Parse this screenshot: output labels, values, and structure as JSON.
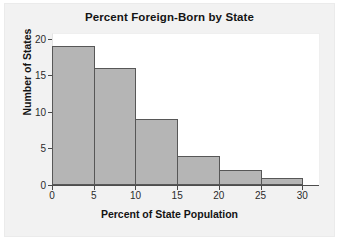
{
  "chart_data": {
    "type": "bar",
    "title": "Percent Foreign-Born by State",
    "xlabel": "Percent of State Population",
    "ylabel": "Number of States",
    "categories": [
      "0-5",
      "5-10",
      "10-15",
      "15-20",
      "20-25",
      "25-30"
    ],
    "bin_edges": [
      0,
      5,
      10,
      15,
      20,
      25,
      30
    ],
    "values": [
      19,
      16,
      9,
      4,
      2,
      1
    ],
    "xlim": [
      0,
      32
    ],
    "ylim": [
      0,
      20.8
    ],
    "xticks": [
      0,
      5,
      10,
      15,
      20,
      25,
      30
    ],
    "yticks": [
      0,
      5,
      10,
      15,
      20
    ],
    "grid": false,
    "legend": false,
    "bar_color": "#b5b5b5",
    "bar_edge_color": "#575757",
    "plot_background": "#ffffff",
    "panel_background": "#f2f2f2"
  }
}
